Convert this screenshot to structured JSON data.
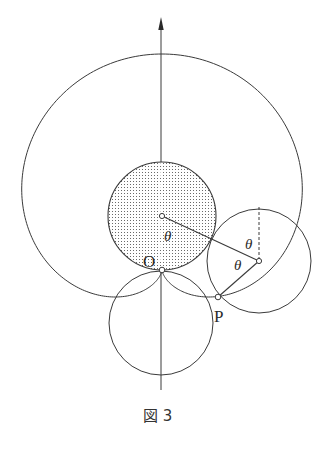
{
  "figure": {
    "caption": "図 3",
    "caption_prefix": "図",
    "caption_number": "3"
  },
  "labels": {
    "origin": "O",
    "point_p": "P",
    "theta_1": "θ",
    "theta_2": "θ",
    "theta_3": "θ"
  },
  "geometry": {
    "fixed_circle": {
      "cx": 162,
      "cy": 216,
      "r": 54,
      "shaded": true
    },
    "lower_circle": {
      "cx": 161,
      "cy": 323,
      "r": 52
    },
    "rolling_circle": {
      "cx": 259,
      "cy": 261,
      "r": 52
    },
    "origin_point": {
      "x": 162,
      "y": 270
    },
    "p_point": {
      "x": 218,
      "y": 297
    },
    "axis": {
      "x": 161,
      "y_top": 18,
      "y_bottom": 390
    },
    "curve": "cardioid"
  },
  "colors": {
    "stroke": "#3a3a3a",
    "shade": "#8a8a8a",
    "background": "#ffffff"
  }
}
